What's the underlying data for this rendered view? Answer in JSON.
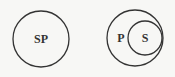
{
  "diagram": {
    "type": "euler-diagram",
    "figures": [
      {
        "id": "identity",
        "relation": "S and P coincide",
        "circles": [
          {
            "label": "SP"
          }
        ]
      },
      {
        "id": "subset",
        "relation": "S contained in P",
        "circles": [
          {
            "label": "P",
            "contains": "S"
          },
          {
            "label": "S"
          }
        ]
      }
    ],
    "colors": {
      "stroke": "#333333",
      "text": "#333333",
      "background": "#f7f7f5"
    }
  }
}
